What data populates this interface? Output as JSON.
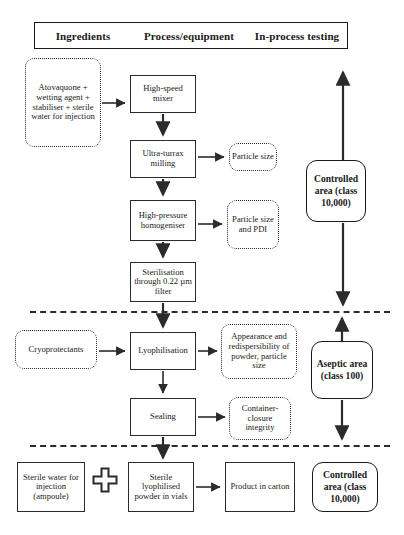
{
  "diagram": {
    "legend": {
      "columns": [
        "Ingredients",
        "Process/equipment",
        "In-process testing"
      ]
    },
    "nodes": {
      "ingredients_top": "Atovaquone + wetting agent + stabiliser + sterile water for injection",
      "high_speed_mixer": "High-speed mixer",
      "ultra_turrax": "Ultra-turrax milling",
      "particle_size": "Particle size",
      "high_pressure": "High-pressure homogeniser",
      "particle_size_pdi": "Particle size and PDI",
      "sterilisation": "Sterilisation through 0.22 µm filter",
      "cryoprotectants": "Cryoprotectants",
      "lyophilisation": "Lyophilisation",
      "appearance": "Appearance and redispersibility of powder, particle size",
      "sealing": "Sealing",
      "container_closure": "Container-closure integrity",
      "sterile_water": "Sterile water for injection (ampoule)",
      "plus_sign": "+",
      "sterile_powder": "Sterile lyophilised powder in vials",
      "product_carton": "Product in carton"
    },
    "areas": {
      "controlled_top": "Controlled area (class 10,000)",
      "aseptic": "Aseptic area (class 100)",
      "controlled_bottom": "Controlled area (class 10,000)"
    },
    "colors": {
      "line": "#2b2b2b",
      "text": "#1a1a1a",
      "background": "#ffffff"
    }
  }
}
